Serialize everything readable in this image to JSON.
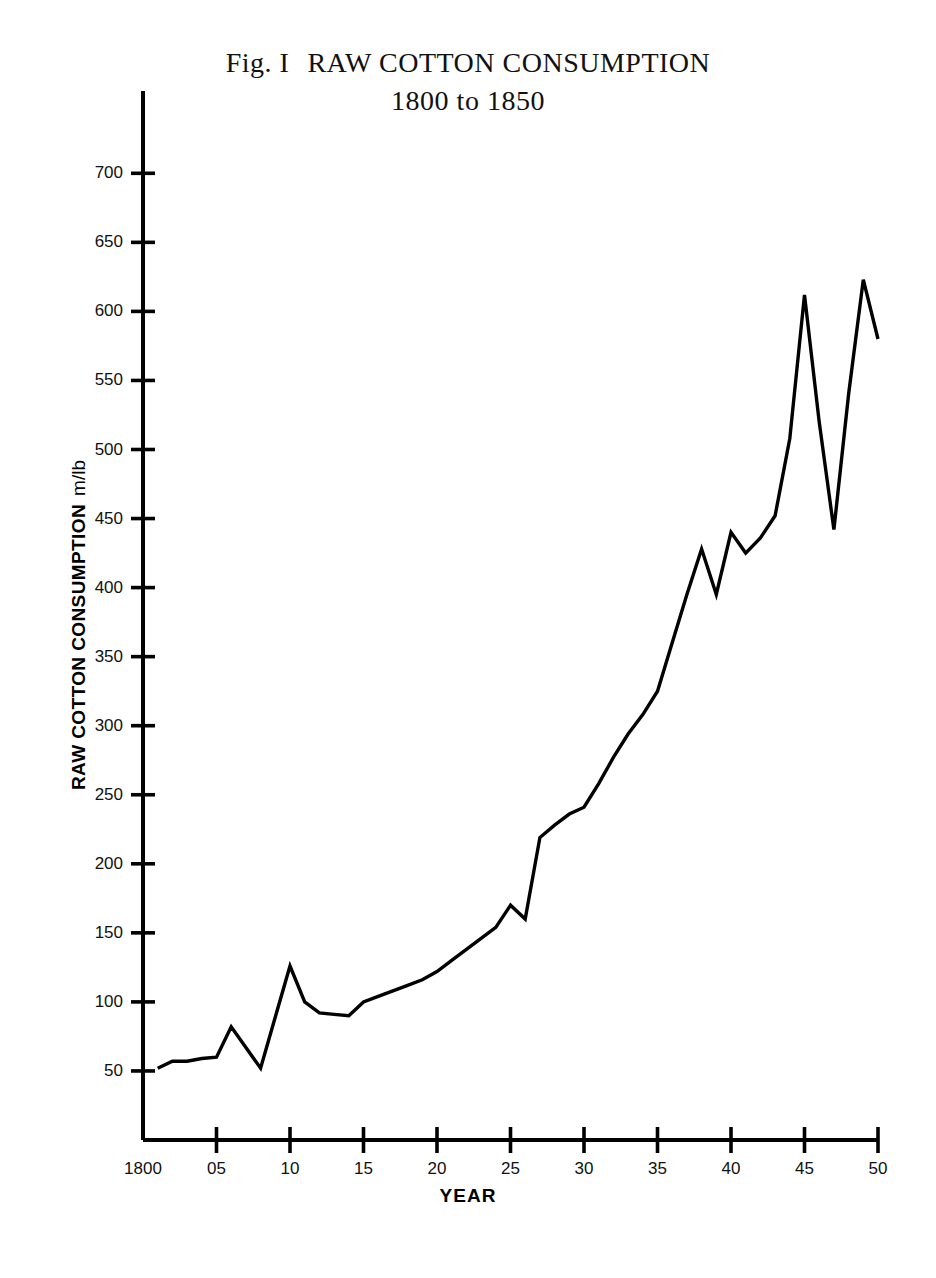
{
  "figure": {
    "fig_label": "Fig. I",
    "title": "RAW COTTON CONSUMPTION",
    "subtitle": "1800 to 1850",
    "y_axis_title": "RAW COTTON CONSUMPTION",
    "y_axis_unit": "m/lb",
    "x_axis_title": "YEAR",
    "line_color": "#000000",
    "axis_color": "#000000",
    "background": "#ffffff"
  },
  "chart_data": {
    "type": "line",
    "subtitle": "1800 to 1850",
    "xlabel": "YEAR",
    "ylabel": "RAW COTTON CONSUMPTION  m/lb",
    "xlim": [
      1800,
      1850
    ],
    "ylim": [
      0,
      730
    ],
    "grid": false,
    "legend": null,
    "x_tick_labels": [
      "1800",
      "05",
      "10",
      "15",
      "20",
      "25",
      "30",
      "35",
      "40",
      "45",
      "50"
    ],
    "x_ticks": [
      1800,
      1805,
      1810,
      1815,
      1820,
      1825,
      1830,
      1835,
      1840,
      1845,
      1850
    ],
    "y_ticks": [
      50,
      100,
      150,
      200,
      250,
      300,
      350,
      400,
      450,
      500,
      550,
      600,
      650,
      700
    ],
    "y_tick_labels": [
      "50",
      "100",
      "150",
      "200",
      "250",
      "300",
      "350",
      "400",
      "450",
      "500",
      "550",
      "600",
      "650",
      "700"
    ],
    "series": [
      {
        "name": "Raw cotton consumption",
        "x": [
          1801,
          1802,
          1803,
          1804,
          1805,
          1806,
          1807,
          1808,
          1809,
          1810,
          1811,
          1812,
          1813,
          1814,
          1815,
          1816,
          1817,
          1818,
          1819,
          1820,
          1821,
          1822,
          1823,
          1824,
          1825,
          1826,
          1827,
          1828,
          1829,
          1830,
          1831,
          1832,
          1833,
          1834,
          1835,
          1836,
          1837,
          1838,
          1839,
          1840,
          1841,
          1842,
          1843,
          1844,
          1845,
          1846,
          1847,
          1848,
          1849,
          1850
        ],
        "values": [
          52,
          57,
          57,
          59,
          60,
          82,
          67,
          52,
          89,
          126,
          100,
          92,
          91,
          90,
          100,
          104,
          108,
          112,
          116,
          122,
          130,
          138,
          146,
          154,
          170,
          160,
          219,
          228,
          236,
          241,
          258,
          277,
          294,
          308,
          325,
          360,
          395,
          428,
          395,
          440,
          425,
          436,
          452,
          508,
          612,
          520,
          442,
          540,
          623,
          580
        ]
      }
    ]
  },
  "geometry": {
    "x_origin_px": 143,
    "x_end_px": 878,
    "y_baseline_px": 1140,
    "y_top_px": 91,
    "px_per_year": 14.7,
    "px_per_unit": 1.381
  }
}
